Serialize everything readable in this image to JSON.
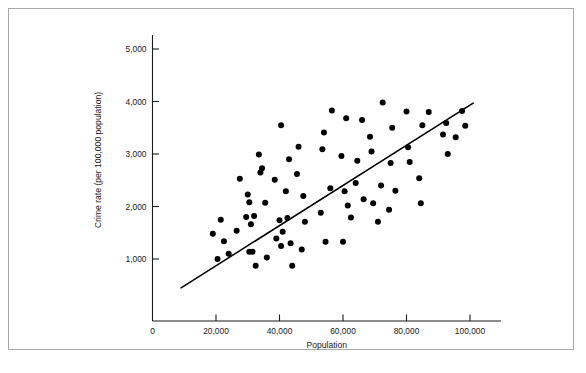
{
  "figure": {
    "caption": "",
    "background_color": "#ffffff",
    "frame_color": "#a8a8a8"
  },
  "chart_data": {
    "type": "scatter",
    "title": "",
    "subtitle": "",
    "xlabel": "Population",
    "ylabel": "Crime rate (per 100,000 population)",
    "xlim": [
      0,
      105000
    ],
    "ylim": [
      0,
      5400
    ],
    "grid": false,
    "legend": null,
    "marker_color": "#000000",
    "marker_size": 3.0,
    "xticks": [
      0,
      20000,
      40000,
      60000,
      80000,
      100000
    ],
    "xticklabels": [
      "0",
      "20,000",
      "40,000",
      "60,000",
      "80,000",
      "100,000"
    ],
    "yticks": [
      1000,
      2000,
      3000,
      4000,
      5000
    ],
    "yticklabels": [
      "1,000",
      "2,000",
      "3,000",
      "4,000",
      "5,000"
    ],
    "trendline": {
      "label": "",
      "color": "#000000",
      "x_start": 9000,
      "y_start": 450,
      "x_end": 101000,
      "y_end": 3970
    },
    "points": [
      [
        19000,
        1480
      ],
      [
        20500,
        1000
      ],
      [
        21500,
        1750
      ],
      [
        22500,
        1340
      ],
      [
        24000,
        1100
      ],
      [
        26500,
        1540
      ],
      [
        27500,
        2530
      ],
      [
        29500,
        1800
      ],
      [
        30000,
        2230
      ],
      [
        30500,
        2080
      ],
      [
        30500,
        1140
      ],
      [
        31000,
        1660
      ],
      [
        31500,
        1140
      ],
      [
        32000,
        1820
      ],
      [
        32500,
        870
      ],
      [
        33500,
        2990
      ],
      [
        34000,
        2650
      ],
      [
        34500,
        2730
      ],
      [
        35500,
        2070
      ],
      [
        36000,
        1030
      ],
      [
        38500,
        2510
      ],
      [
        39000,
        1390
      ],
      [
        40000,
        1740
      ],
      [
        40500,
        1250
      ],
      [
        40500,
        3550
      ],
      [
        41000,
        1520
      ],
      [
        42000,
        2290
      ],
      [
        42500,
        1780
      ],
      [
        43000,
        2900
      ],
      [
        43500,
        1300
      ],
      [
        44000,
        870
      ],
      [
        45500,
        2620
      ],
      [
        46000,
        3140
      ],
      [
        47000,
        1180
      ],
      [
        47500,
        2200
      ],
      [
        48000,
        1710
      ],
      [
        53000,
        1880
      ],
      [
        53500,
        3090
      ],
      [
        54000,
        3410
      ],
      [
        54500,
        1330
      ],
      [
        56000,
        2350
      ],
      [
        56500,
        3830
      ],
      [
        59500,
        2960
      ],
      [
        60000,
        1330
      ],
      [
        60500,
        2290
      ],
      [
        61000,
        3680
      ],
      [
        61500,
        2020
      ],
      [
        62500,
        1790
      ],
      [
        64000,
        2450
      ],
      [
        64500,
        2870
      ],
      [
        66000,
        3650
      ],
      [
        66500,
        2140
      ],
      [
        68500,
        3330
      ],
      [
        69000,
        3050
      ],
      [
        69500,
        2060
      ],
      [
        71000,
        1710
      ],
      [
        72000,
        2400
      ],
      [
        72500,
        3980
      ],
      [
        74500,
        1940
      ],
      [
        75000,
        2830
      ],
      [
        75500,
        3500
      ],
      [
        76500,
        2300
      ],
      [
        80000,
        3810
      ],
      [
        80500,
        3130
      ],
      [
        81000,
        2850
      ],
      [
        84000,
        2540
      ],
      [
        84500,
        2060
      ],
      [
        85000,
        3550
      ],
      [
        87000,
        3800
      ],
      [
        91500,
        3370
      ],
      [
        92500,
        3590
      ],
      [
        93000,
        3000
      ],
      [
        95500,
        3320
      ],
      [
        97500,
        3820
      ],
      [
        98500,
        3540
      ]
    ]
  }
}
